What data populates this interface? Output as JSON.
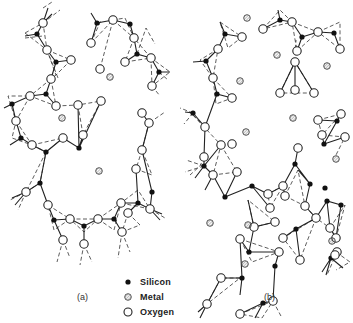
{
  "figure": {
    "panel_a_label": "(a)",
    "panel_b_label": "(b)",
    "legend": [
      {
        "symbol": "filled-circle",
        "label": "Silicon"
      },
      {
        "symbol": "hatched-circle",
        "label": "Metal"
      },
      {
        "symbol": "open-circle",
        "label": "Oxygen"
      }
    ],
    "colors": {
      "line": "#222222",
      "background": "#ffffff",
      "silicon": "#111111"
    }
  },
  "diagram": {
    "panel_a": {
      "silicon": [
        [
          37,
          34
        ],
        [
          56,
          62
        ],
        [
          97,
          23
        ],
        [
          130,
          24
        ],
        [
          137,
          54
        ],
        [
          159,
          72
        ],
        [
          12,
          104
        ],
        [
          46,
          94
        ],
        [
          21,
          138
        ],
        [
          79,
          148
        ],
        [
          46,
          152
        ],
        [
          40,
          183
        ],
        [
          54,
          220
        ],
        [
          84,
          226
        ],
        [
          114,
          219
        ],
        [
          138,
          203
        ],
        [
          152,
          192
        ]
      ],
      "oxygen": [
        [
          43,
          23
        ],
        [
          47,
          50
        ],
        [
          71,
          60
        ],
        [
          100,
          69
        ],
        [
          91,
          43
        ],
        [
          113,
          20
        ],
        [
          134,
          38
        ],
        [
          125,
          62
        ],
        [
          151,
          58
        ],
        [
          152,
          86
        ],
        [
          51,
          79
        ],
        [
          30,
          96
        ],
        [
          56,
          106
        ],
        [
          16,
          121
        ],
        [
          32,
          145
        ],
        [
          63,
          138
        ],
        [
          83,
          135
        ],
        [
          78,
          105
        ],
        [
          101,
          101
        ],
        [
          142,
          113
        ],
        [
          149,
          123
        ],
        [
          142,
          150
        ],
        [
          136,
          169
        ],
        [
          121,
          203
        ],
        [
          128,
          213
        ],
        [
          150,
          209
        ],
        [
          26,
          192
        ],
        [
          48,
          205
        ],
        [
          70,
          219
        ],
        [
          98,
          219
        ],
        [
          63,
          240
        ],
        [
          84,
          244
        ],
        [
          122,
          232
        ]
      ],
      "metal": [
        [
          110,
          77
        ],
        [
          62,
          118
        ],
        [
          99,
          171
        ]
      ]
    },
    "panel_b": {
      "silicon": [
        [
          225,
          34
        ],
        [
          206,
          61
        ],
        [
          217,
          94
        ],
        [
          193,
          113
        ],
        [
          204,
          166
        ],
        [
          280,
          20
        ],
        [
          302,
          37
        ],
        [
          334,
          33
        ],
        [
          295,
          164
        ],
        [
          310,
          184
        ],
        [
          327,
          201
        ],
        [
          225,
          197
        ],
        [
          252,
          186
        ],
        [
          296,
          229
        ],
        [
          341,
          205
        ],
        [
          249,
          252
        ],
        [
          275,
          266
        ],
        [
          331,
          258
        ],
        [
          337,
          121
        ],
        [
          324,
          144
        ],
        [
          242,
          278
        ],
        [
          263,
          303
        ],
        [
          325,
          188
        ]
      ],
      "oxygen": [
        [
          242,
          37
        ],
        [
          218,
          49
        ],
        [
          213,
          78
        ],
        [
          232,
          98
        ],
        [
          205,
          127
        ],
        [
          221,
          145
        ],
        [
          213,
          175
        ],
        [
          237,
          172
        ],
        [
          263,
          29
        ],
        [
          292,
          22
        ],
        [
          297,
          51
        ],
        [
          318,
          32
        ],
        [
          340,
          49
        ],
        [
          295,
          62
        ],
        [
          295,
          90
        ],
        [
          280,
          93
        ],
        [
          314,
          93
        ],
        [
          318,
          120
        ],
        [
          341,
          114
        ],
        [
          322,
          135
        ],
        [
          345,
          137
        ],
        [
          298,
          148
        ],
        [
          283,
          186
        ],
        [
          268,
          194
        ],
        [
          270,
          208
        ],
        [
          305,
          206
        ],
        [
          285,
          196
        ],
        [
          275,
          222
        ],
        [
          254,
          227
        ],
        [
          283,
          238
        ],
        [
          316,
          218
        ],
        [
          300,
          260
        ],
        [
          330,
          228
        ],
        [
          337,
          252
        ],
        [
          204,
          157
        ],
        [
          232,
          144
        ],
        [
          240,
          239
        ],
        [
          279,
          252
        ],
        [
          221,
          278
        ],
        [
          207,
          304
        ],
        [
          240,
          314
        ],
        [
          273,
          301
        ],
        [
          336,
          238
        ],
        [
          335,
          255
        ]
      ],
      "metal": [
        [
          247,
          18
        ],
        [
          277,
          55
        ],
        [
          327,
          66
        ],
        [
          240,
          81
        ],
        [
          293,
          118
        ],
        [
          336,
          159
        ],
        [
          246,
          132
        ],
        [
          210,
          223
        ],
        [
          248,
          225
        ],
        [
          332,
          241
        ],
        [
          245,
          264
        ]
      ]
    },
    "legend_positions": {
      "silicon": [
        128,
        283
      ],
      "metal": [
        128,
        298
      ],
      "oxygen": [
        128,
        313
      ]
    }
  }
}
